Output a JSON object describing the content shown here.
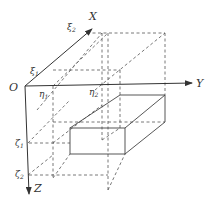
{
  "diagram": {
    "axes": {
      "origin_label": "O",
      "x_label": "X",
      "y_label": "Y",
      "z_label": "Z"
    },
    "ticks": {
      "xi1": "ξ",
      "xi1_sub": "1",
      "xi2": "ξ",
      "xi2_sub": "2",
      "eta1": "η",
      "eta1_sub": "1",
      "eta2": "η",
      "eta2_sub": "2",
      "zeta1": "ζ",
      "zeta1_sub": "1",
      "zeta2": "ζ",
      "zeta2_sub": "2"
    },
    "colors": {
      "line": "#444444",
      "dashed": "#555555"
    }
  }
}
